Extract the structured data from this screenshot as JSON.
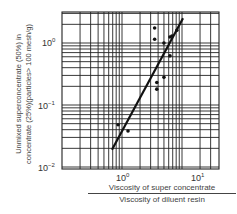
{
  "chart_data": {
    "type": "scatter",
    "title": "",
    "xlabel": "Viscosity of super concentrate / Viscosity of diluent resin",
    "xlabel_numerator": "Viscosity of super concentrate",
    "xlabel_denominator": "Viscosity of diluent resin",
    "ylabel": "Unmixed superconcentrate (50%) in concentrate (25%)(particles> 100 mesh/g)",
    "ylabel_line1": "Unmixed superconcentrate (50%) in",
    "ylabel_line2": "concentrate (25%)(particles> 100 mesh/g)",
    "xscale": "log",
    "yscale": "log",
    "xlim": [
      0.1,
      40
    ],
    "ylim": [
      0.01,
      3
    ],
    "grid": true,
    "x_ticks": [
      {
        "base": "10",
        "exp": "0",
        "value": 1
      },
      {
        "base": "10",
        "exp": "1",
        "value": 10
      }
    ],
    "y_ticks": [
      {
        "base": "10",
        "exp": "0",
        "value": 1
      },
      {
        "base": "10",
        "exp": "-1",
        "value": 0.1
      },
      {
        "base": "10",
        "exp": "-2",
        "value": 0.01
      }
    ],
    "series": [
      {
        "name": "data points",
        "type": "scatter",
        "x": [
          3.5,
          3.5,
          5.0,
          6.3,
          6.8,
          6.3,
          5.0,
          3.8,
          3.8,
          8.2,
          0.86,
          1.26
        ],
        "y": [
          1.75,
          1.15,
          1.0,
          1.25,
          1.3,
          0.62,
          0.28,
          0.23,
          0.18,
          1.6,
          0.048,
          0.038
        ]
      },
      {
        "name": "fit line",
        "type": "line",
        "x": [
          0.68,
          10.4
        ],
        "y": [
          0.019,
          2.5
        ]
      }
    ]
  }
}
